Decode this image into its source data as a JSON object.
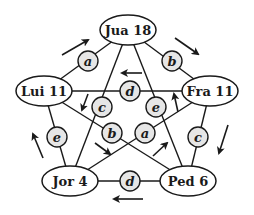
{
  "nodes": [
    {
      "id": "jua",
      "label": "Jua 18",
      "x": 128,
      "y": 30
    },
    {
      "id": "lui",
      "label": "Lui 11",
      "x": 44,
      "y": 91
    },
    {
      "id": "fra",
      "label": "Fra 11",
      "x": 210,
      "y": 91
    },
    {
      "id": "jor",
      "label": "Jor 4",
      "x": 70,
      "y": 181
    },
    {
      "id": "ped",
      "label": "Ped 6",
      "x": 188,
      "y": 181
    }
  ],
  "edges": [
    {
      "from": "lui",
      "to": "jua",
      "label": "a",
      "x": 88,
      "y": 61
    },
    {
      "from": "jua",
      "to": "fra",
      "label": "b",
      "x": 172,
      "y": 61
    },
    {
      "from": "lui",
      "to": "fra",
      "label": "d",
      "x": 130,
      "y": 91
    },
    {
      "from": "jua",
      "to": "jor",
      "label": "c",
      "x": 102,
      "y": 107
    },
    {
      "from": "jua",
      "to": "ped",
      "label": "e",
      "x": 156,
      "y": 107
    },
    {
      "from": "lui",
      "to": "jor",
      "label": "e",
      "x": 57,
      "y": 137
    },
    {
      "from": "lui",
      "to": "ped",
      "label": "b",
      "x": 112,
      "y": 133
    },
    {
      "from": "fra",
      "to": "jor",
      "label": "a",
      "x": 145,
      "y": 133
    },
    {
      "from": "fra",
      "to": "ped",
      "label": "c",
      "x": 198,
      "y": 137
    },
    {
      "from": "jor",
      "to": "ped",
      "label": "d",
      "x": 130,
      "y": 181
    }
  ],
  "arrows": [
    {
      "near": "lui-jua",
      "x1": 62,
      "y1": 55,
      "x2": 88,
      "y2": 40
    },
    {
      "near": "jua-fra",
      "x1": 175,
      "y1": 38,
      "x2": 198,
      "y2": 54
    },
    {
      "near": "lui-fra",
      "x1": 142,
      "y1": 73,
      "x2": 122,
      "y2": 73
    },
    {
      "near": "jua-jor",
      "x1": 88,
      "y1": 94,
      "x2": 82,
      "y2": 110
    },
    {
      "near": "jua-ped",
      "x1": 178,
      "y1": 112,
      "x2": 174,
      "y2": 94
    },
    {
      "near": "lui-jor",
      "x1": 43,
      "y1": 158,
      "x2": 33,
      "y2": 134
    },
    {
      "near": "lui-ped",
      "x1": 95,
      "y1": 143,
      "x2": 110,
      "y2": 154
    },
    {
      "near": "fra-jor",
      "x1": 153,
      "y1": 156,
      "x2": 167,
      "y2": 143
    },
    {
      "near": "fra-ped",
      "x1": 228,
      "y1": 125,
      "x2": 219,
      "y2": 153
    },
    {
      "near": "jor-ped",
      "x1": 143,
      "y1": 199,
      "x2": 114,
      "y2": 199
    }
  ]
}
